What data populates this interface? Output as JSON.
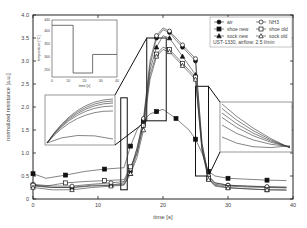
{
  "chart_data": {
    "type": "line",
    "title": "",
    "xlabel": "time [s]",
    "ylabel": "normalized resistance [a.u.]",
    "xlim": [
      0,
      40
    ],
    "ylim": [
      0,
      4.0
    ],
    "xticks": [
      "0",
      "10",
      "20",
      "30",
      "40"
    ],
    "yticks": [
      "0",
      "0.5",
      "1.0",
      "1.5",
      "2.0",
      "2.5",
      "3.0",
      "3.5",
      "4.0"
    ],
    "annotation": "UST-1330, airflow: 2.5 l/min",
    "legend_position": "upper right",
    "series": [
      {
        "name": "air",
        "marker": "filled-circle",
        "x": [
          0,
          3,
          6,
          9,
          12,
          14,
          15,
          16,
          17,
          18,
          19,
          20,
          21,
          22,
          23,
          24,
          25,
          26,
          27,
          28,
          30,
          33,
          36,
          39
        ],
        "y": [
          0.3,
          0.25,
          0.25,
          0.3,
          0.3,
          0.35,
          0.6,
          1.1,
          1.7,
          2.9,
          3.5,
          3.68,
          3.62,
          3.45,
          3.3,
          3.15,
          3.0,
          1.2,
          0.5,
          0.35,
          0.3,
          0.28,
          0.26,
          0.25
        ]
      },
      {
        "name": "shoe new",
        "marker": "filled-square",
        "x": [
          0,
          2,
          5,
          8,
          11,
          14,
          15,
          16,
          17,
          18,
          19,
          20,
          22,
          24,
          25,
          26,
          27,
          28,
          30,
          33,
          36,
          39
        ],
        "y": [
          0.55,
          0.45,
          0.52,
          0.6,
          0.65,
          0.68,
          1.15,
          1.5,
          1.7,
          1.85,
          1.9,
          1.95,
          1.75,
          1.5,
          1.3,
          1.0,
          0.6,
          0.5,
          0.45,
          0.43,
          0.41,
          0.4
        ]
      },
      {
        "name": "sock new",
        "marker": "filled-triangle",
        "x": [
          0,
          3,
          6,
          9,
          12,
          14,
          15,
          16,
          17,
          18,
          19,
          20,
          21,
          22,
          23,
          24,
          25,
          26,
          27,
          28,
          30,
          33,
          36,
          39
        ],
        "y": [
          0.28,
          0.25,
          0.25,
          0.28,
          0.3,
          0.32,
          0.55,
          1.0,
          1.65,
          2.8,
          3.3,
          3.55,
          3.5,
          3.3,
          3.1,
          2.9,
          2.7,
          1.1,
          0.45,
          0.32,
          0.28,
          0.26,
          0.25,
          0.24
        ]
      },
      {
        "name": "NH3",
        "marker": "open-circle",
        "x": [
          0,
          3,
          6,
          9,
          12,
          14,
          15,
          16,
          17,
          18,
          19,
          20,
          21,
          22,
          23,
          24,
          25,
          26,
          27,
          28,
          30,
          33,
          36,
          39
        ],
        "y": [
          0.32,
          0.28,
          0.28,
          0.32,
          0.35,
          0.38,
          0.65,
          1.1,
          1.75,
          3.0,
          3.55,
          3.72,
          3.65,
          3.5,
          3.35,
          3.2,
          3.05,
          1.2,
          0.5,
          0.35,
          0.3,
          0.28,
          0.27,
          0.26
        ]
      },
      {
        "name": "shoe old",
        "marker": "open-square",
        "x": [
          0,
          2,
          5,
          8,
          11,
          14,
          15,
          16,
          17,
          18,
          19,
          20,
          21,
          22,
          23,
          24,
          25,
          26,
          27,
          28,
          30,
          33,
          36,
          39
        ],
        "y": [
          0.3,
          0.28,
          0.35,
          0.38,
          0.4,
          0.42,
          0.7,
          1.0,
          1.6,
          2.7,
          3.15,
          3.3,
          3.25,
          3.1,
          2.95,
          2.8,
          2.65,
          1.1,
          0.45,
          0.3,
          0.25,
          0.22,
          0.2,
          0.2
        ]
      },
      {
        "name": "sock old",
        "marker": "open-triangle",
        "x": [
          0,
          3,
          6,
          9,
          12,
          14,
          15,
          16,
          17,
          18,
          19,
          20,
          21,
          22,
          23,
          24,
          25,
          26,
          27,
          28,
          30,
          33,
          36,
          39
        ],
        "y": [
          0.25,
          0.2,
          0.2,
          0.25,
          0.28,
          0.3,
          0.55,
          0.9,
          1.5,
          2.6,
          3.1,
          3.25,
          3.2,
          3.05,
          2.9,
          2.75,
          2.6,
          1.05,
          0.42,
          0.28,
          0.24,
          0.22,
          0.2,
          0.19
        ]
      }
    ],
    "zoom_boxes": [
      {
        "x0": 13.5,
        "x1": 14.5,
        "y0": 0.2,
        "y1": 2.2
      },
      {
        "x0": 17.5,
        "x1": 20.5,
        "y0": 1.7,
        "y1": 3.5
      },
      {
        "x0": 25.0,
        "x1": 27.0,
        "y0": 0.5,
        "y1": 2.45
      }
    ],
    "inset": {
      "type": "line",
      "xlabel": "time [s]",
      "ylabel": "temperature [°C]",
      "xlim": [
        0,
        40
      ],
      "ylim": [
        225,
        440
      ],
      "xticks": [
        "0",
        "10",
        "20",
        "30",
        "40"
      ],
      "yticks": [
        "250",
        "300",
        "350",
        "400",
        "440"
      ],
      "x": [
        0,
        13,
        13,
        25,
        25,
        40
      ],
      "y": [
        420,
        420,
        240,
        240,
        310,
        310
      ]
    }
  }
}
